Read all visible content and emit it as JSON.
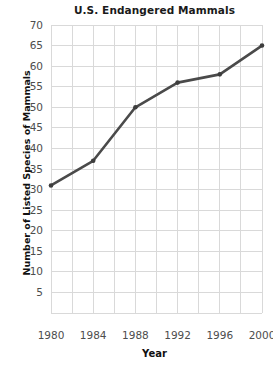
{
  "chart_data": {
    "type": "line",
    "title": "U.S. Endangered Mammals",
    "xlabel": "Year",
    "ylabel": "Number of Listed Species of Mammals",
    "x": [
      1980,
      1984,
      1988,
      1992,
      1996,
      2000
    ],
    "values": [
      31,
      37,
      50,
      56,
      58,
      65
    ],
    "series": [
      {
        "name": "Listed Species of Mammals",
        "values": [
          31,
          37,
          50,
          56,
          58,
          65
        ]
      }
    ],
    "xlim": [
      1980,
      2000
    ],
    "ylim": [
      0,
      70
    ],
    "ytick_labels": [
      "70",
      "65",
      "60",
      "55",
      "50",
      "45",
      "40",
      "35",
      "30",
      "25",
      "20",
      "15",
      "10",
      "5"
    ],
    "ytick_values": [
      70,
      65,
      60,
      55,
      50,
      45,
      40,
      35,
      30,
      25,
      20,
      15,
      10,
      5
    ],
    "xtick_labels": [
      "1980",
      "1984",
      "1988",
      "1992",
      "1996",
      "2000"
    ],
    "xtick_values": [
      1980,
      1984,
      1988,
      1992,
      1996,
      2000
    ],
    "x_minor_step": 2,
    "y_minor_step": 5,
    "grid": true,
    "legend": false,
    "legend_position": "none",
    "marker": "circle",
    "line_color": "#4a4a4a",
    "marker_color": "#3d3d3d",
    "grid_color": "#d9d9d9",
    "background_color": "#ffffff",
    "tick_label_color": "#4d4d4d",
    "title_color": "#1a1a1a"
  }
}
